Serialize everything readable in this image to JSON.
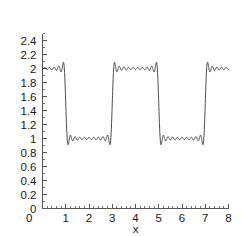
{
  "chart_data": {
    "type": "line",
    "title": "",
    "subtitle": "",
    "xlabel": "x",
    "ylabel": "",
    "xlim": [
      0,
      8
    ],
    "ylim": [
      0,
      2.5
    ],
    "grid": false,
    "legend": null,
    "x_ticks": [
      0,
      1,
      2,
      3,
      4,
      5,
      6,
      7,
      8
    ],
    "x_tick_labels": [
      "0",
      "1",
      "2",
      "3",
      "4",
      "5",
      "6",
      "7",
      "8"
    ],
    "y_ticks": [
      0,
      0.2,
      0.4,
      0.6,
      0.8,
      1.0,
      1.2,
      1.4,
      1.6,
      1.8,
      2.0,
      2.2,
      2.4
    ],
    "y_tick_labels": [
      "0",
      "0.2",
      "0.4",
      "0.6",
      "0.8",
      "1",
      "1.2",
      "1.4",
      "1.6",
      "1.8",
      "2",
      "2.2",
      "2.4"
    ],
    "x_minor_ticks_per_interval": 5,
    "y_minor_ticks_per_interval": 2,
    "series": [
      {
        "name": "square wave partial sum",
        "color": "#3a3a3a",
        "line_width": 0.9,
        "harmonics": 19,
        "period": 4,
        "high_level": 2,
        "low_level": 1,
        "mean_level": 1.5,
        "amplitude": 0.5,
        "overshoot": 0.09,
        "transitions": [
          2,
          4,
          6,
          8
        ],
        "samples": 1400
      }
    ]
  },
  "axis": {
    "x_label": "x",
    "y_label": ""
  }
}
